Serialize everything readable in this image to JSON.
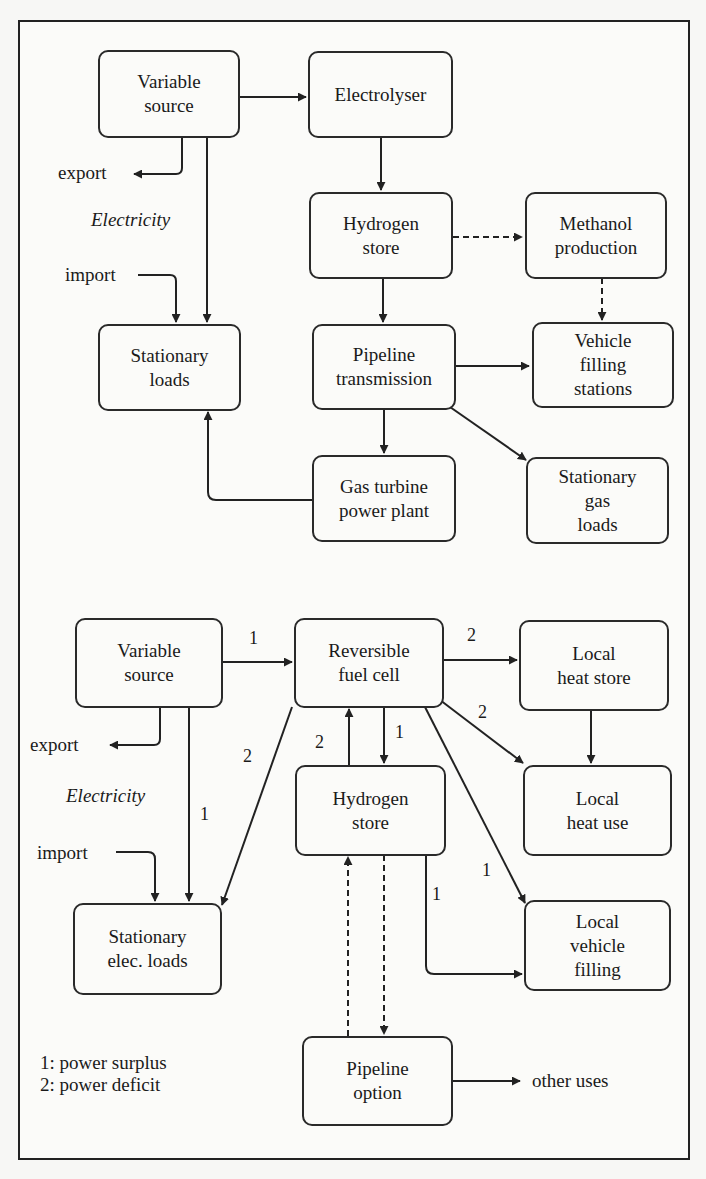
{
  "colors": {
    "line": "#222222",
    "box_border": "#2a2a2a",
    "background": "#fbfbf9"
  },
  "top_diagram": {
    "nodes": {
      "variable_source": "Variable\nsource",
      "electrolyser": "Electrolyser",
      "hydrogen_store": "Hydrogen\nstore",
      "methanol_production": "Methanol\nproduction",
      "stationary_loads": "Stationary\nloads",
      "pipeline_transmission": "Pipeline\ntransmission",
      "vehicle_filling_stations": "Vehicle\nfilling\nstations",
      "gas_turbine": "Gas turbine\npower plant",
      "stationary_gas_loads": "Stationary\ngas\nloads"
    },
    "labels": {
      "export": "export",
      "electricity": "Electricity",
      "import": "import"
    },
    "edges": [
      {
        "from": "Variable source",
        "to": "Electrolyser",
        "style": "solid"
      },
      {
        "from": "Variable source",
        "to": "export",
        "style": "solid"
      },
      {
        "from": "Variable source",
        "to": "Stationary loads",
        "style": "solid"
      },
      {
        "from": "import",
        "to": "Stationary loads",
        "style": "solid"
      },
      {
        "from": "Electrolyser",
        "to": "Hydrogen store",
        "style": "solid"
      },
      {
        "from": "Hydrogen store",
        "to": "Methanol production",
        "style": "dashed"
      },
      {
        "from": "Methanol production",
        "to": "Vehicle filling stations",
        "style": "dashed"
      },
      {
        "from": "Hydrogen store",
        "to": "Pipeline transmission",
        "style": "solid"
      },
      {
        "from": "Pipeline transmission",
        "to": "Vehicle filling stations",
        "style": "solid"
      },
      {
        "from": "Pipeline transmission",
        "to": "Gas turbine power plant",
        "style": "solid"
      },
      {
        "from": "Pipeline transmission",
        "to": "Stationary gas loads",
        "style": "solid"
      },
      {
        "from": "Gas turbine power plant",
        "to": "Stationary loads",
        "style": "solid"
      }
    ]
  },
  "bottom_diagram": {
    "nodes": {
      "variable_source": "Variable\nsource",
      "reversible_fuel_cell": "Reversible\nfuel cell",
      "local_heat_store": "Local\nheat store",
      "hydrogen_store": "Hydrogen\nstore",
      "local_heat_use": "Local\nheat use",
      "stationary_elec_loads": "Stationary\nelec. loads",
      "local_vehicle_filling": "Local\nvehicle\nfilling",
      "pipeline_option": "Pipeline\noption"
    },
    "labels": {
      "export": "export",
      "electricity": "Electricity",
      "import": "import",
      "other_uses": "other uses"
    },
    "edge_numbers": {
      "vs_to_rfc": "1",
      "rfc_to_heat_store": "2",
      "rfc_to_heat_use": "2",
      "rfc_to_h2": "1",
      "h2_to_rfc": "2",
      "rfc_to_loads": "2",
      "vs_to_loads": "1",
      "rfc_to_vehicle": "1",
      "h2_to_vehicle": "1"
    },
    "legend": {
      "line1": "1: power surplus",
      "line2": "2: power deficit"
    },
    "edges": [
      {
        "from": "Variable source",
        "to": "Reversible fuel cell",
        "label": "1",
        "style": "solid"
      },
      {
        "from": "Variable source",
        "to": "export",
        "style": "solid"
      },
      {
        "from": "Variable source",
        "to": "Stationary elec. loads",
        "label": "1",
        "style": "solid"
      },
      {
        "from": "import",
        "to": "Stationary elec. loads",
        "style": "solid"
      },
      {
        "from": "Reversible fuel cell",
        "to": "Local heat store",
        "label": "2",
        "style": "solid"
      },
      {
        "from": "Reversible fuel cell",
        "to": "Local heat use",
        "label": "2",
        "style": "solid"
      },
      {
        "from": "Local heat store",
        "to": "Local heat use",
        "style": "solid"
      },
      {
        "from": "Reversible fuel cell",
        "to": "Hydrogen store",
        "label": "1",
        "style": "solid"
      },
      {
        "from": "Hydrogen store",
        "to": "Reversible fuel cell",
        "label": "2",
        "style": "solid"
      },
      {
        "from": "Reversible fuel cell",
        "to": "Stationary elec. loads",
        "label": "2",
        "style": "solid"
      },
      {
        "from": "Reversible fuel cell",
        "to": "Local vehicle filling",
        "label": "1",
        "style": "solid"
      },
      {
        "from": "Hydrogen store",
        "to": "Local vehicle filling",
        "label": "1",
        "style": "solid"
      },
      {
        "from": "Hydrogen store",
        "to": "Pipeline option",
        "style": "dashed"
      },
      {
        "from": "Pipeline option",
        "to": "Hydrogen store",
        "style": "dashed"
      },
      {
        "from": "Pipeline option",
        "to": "other uses",
        "style": "solid"
      }
    ]
  }
}
